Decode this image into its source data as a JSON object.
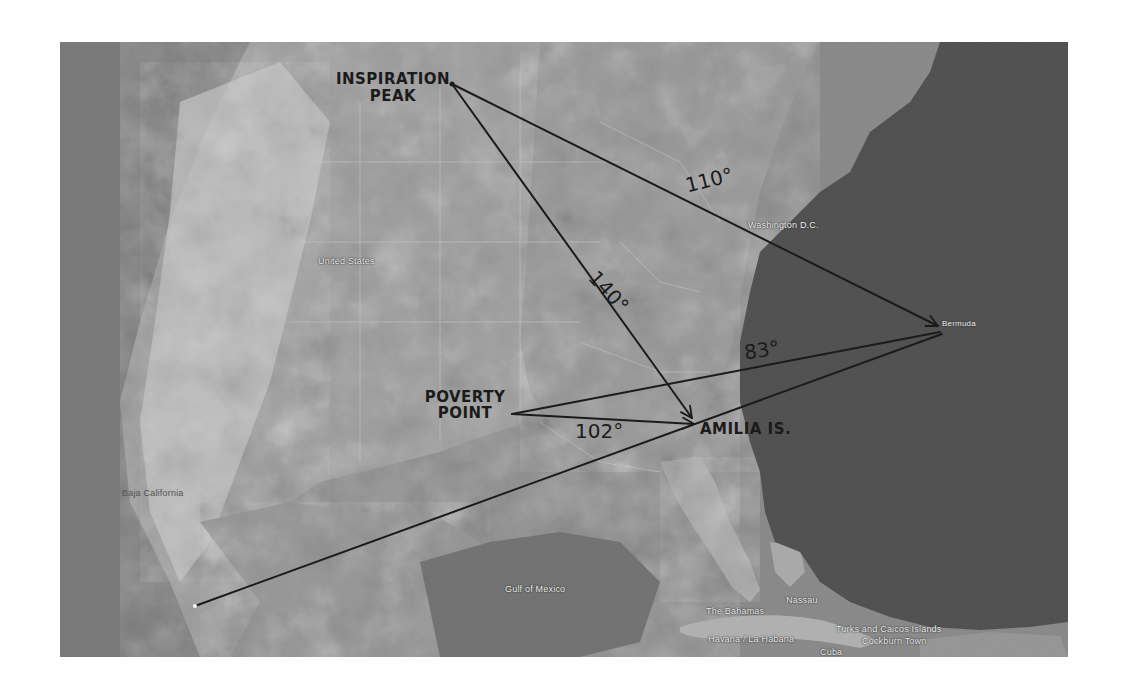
{
  "map": {
    "type": "satellite",
    "colors": {
      "land_light": "#c8c8c8",
      "land_mid": "#9a9a9a",
      "shelf_water": "#8e8e8e",
      "deep_ocean": "#4a4a4a",
      "annotation_ink": "#1b1b1b"
    },
    "places": [
      {
        "name": "United States"
      },
      {
        "name": "Washington D.C."
      },
      {
        "name": "Bermuda"
      },
      {
        "name": "Baja California"
      },
      {
        "name": "Gulf of Mexico"
      },
      {
        "name": "The Bahamas"
      },
      {
        "name": "Nassau"
      },
      {
        "name": "Havana / La Habana"
      },
      {
        "name": "Turks and Caicos Islands"
      },
      {
        "name": "Cockburn Town"
      },
      {
        "name": "Cuba"
      },
      {
        "name": "Dominican Republic"
      }
    ]
  },
  "annotations": {
    "labels": [
      {
        "text_line1": "INSPIRATION",
        "text_line2": "PEAK"
      },
      {
        "text_line1": "POVERTY",
        "text_line2": "POINT"
      },
      {
        "text": "AMILIA IS."
      }
    ],
    "angles": [
      {
        "text": "110°",
        "line": "Inspiration Peak → Bermuda"
      },
      {
        "text": "140°",
        "line": "Inspiration Peak → Amilia Is."
      },
      {
        "text": "83°",
        "line": "Poverty Point → Bermuda"
      },
      {
        "text": "102°",
        "line": "Poverty Point → Amilia Is."
      }
    ],
    "lines": [
      {
        "from": "Inspiration Peak",
        "to": "Bermuda",
        "arrow": true
      },
      {
        "from": "Inspiration Peak",
        "to": "Amilia Is.",
        "arrow": true
      },
      {
        "from": "Poverty Point",
        "to": "Bermuda",
        "arrow": false
      },
      {
        "from": "Poverty Point",
        "to": "Amilia Is.",
        "arrow": true
      },
      {
        "from": "Baja California",
        "to": "Bermuda",
        "arrow": false
      }
    ]
  }
}
